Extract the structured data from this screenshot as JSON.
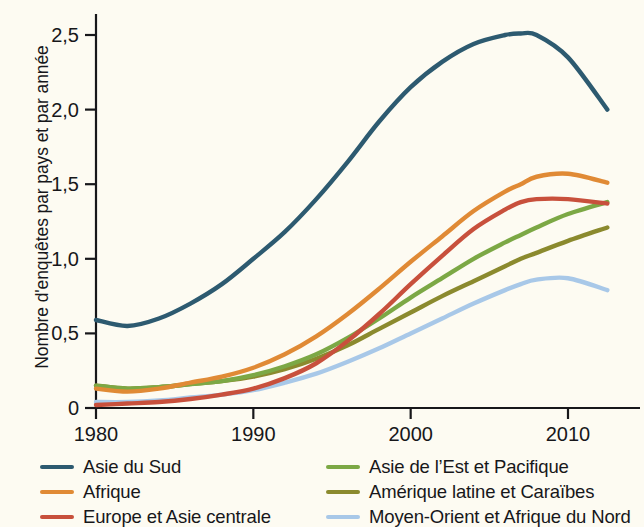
{
  "axes": {
    "y_title": "Nombre d'enquêtes par pays et par année",
    "y_ticks": [
      "2,5",
      "2,0",
      "1,5",
      "1,0",
      "0,5",
      "0"
    ],
    "x_ticks": [
      "1980",
      "1990",
      "2000",
      "2010"
    ]
  },
  "legend": {
    "left": [
      {
        "label": "Asie du Sud",
        "color": "#2d5a70"
      },
      {
        "label": "Afrique",
        "color": "#e08a35"
      },
      {
        "label": "Europe et Asie centrale",
        "color": "#c8503c"
      }
    ],
    "right": [
      {
        "label": "Asie de l’Est et Pacifique",
        "color": "#7ca845"
      },
      {
        "label": "Amérique latine et Caraïbes",
        "color": "#8b8a2e"
      },
      {
        "label": "Moyen-Orient et Afrique du Nord",
        "color": "#a8c8e8"
      }
    ]
  },
  "chart_data": {
    "type": "line",
    "title": "",
    "xlabel": "",
    "ylabel": "Nombre d'enquêtes par pays et par année",
    "xlim": [
      1980,
      2012.5
    ],
    "ylim": [
      0,
      2.65
    ],
    "xticks": [
      1980,
      1990,
      2000,
      2010
    ],
    "yticks": [
      0,
      0.5,
      1.0,
      1.5,
      2.0,
      2.5
    ],
    "ytick_labels": [
      "0",
      "0,5",
      "1,0",
      "1,5",
      "2,0",
      "2,5"
    ],
    "grid": false,
    "legend_position": "below",
    "background": "#fdfbf2",
    "x": [
      1980,
      1982,
      1984,
      1986,
      1988,
      1990,
      1992,
      1994,
      1996,
      1998,
      2000,
      2002,
      2004,
      2006,
      2007,
      2008,
      2010,
      2012.5
    ],
    "series": [
      {
        "name": "Asie du Sud",
        "color": "#2d5a70",
        "values": [
          0.59,
          0.55,
          0.6,
          0.7,
          0.83,
          1.0,
          1.18,
          1.4,
          1.65,
          1.92,
          2.15,
          2.32,
          2.44,
          2.5,
          2.51,
          2.5,
          2.35,
          2.0
        ]
      },
      {
        "name": "Afrique",
        "color": "#e08a35",
        "values": [
          0.13,
          0.11,
          0.13,
          0.17,
          0.21,
          0.27,
          0.36,
          0.48,
          0.63,
          0.8,
          0.98,
          1.15,
          1.32,
          1.45,
          1.5,
          1.55,
          1.57,
          1.51
        ]
      },
      {
        "name": "Europe et Asie centrale",
        "color": "#c8503c",
        "values": [
          0.02,
          0.03,
          0.04,
          0.06,
          0.09,
          0.13,
          0.2,
          0.3,
          0.45,
          0.63,
          0.83,
          1.02,
          1.2,
          1.33,
          1.38,
          1.4,
          1.4,
          1.37
        ]
      },
      {
        "name": "Asie de l’Est et Pacifique",
        "color": "#7ca845",
        "values": [
          0.15,
          0.13,
          0.14,
          0.16,
          0.18,
          0.22,
          0.28,
          0.36,
          0.47,
          0.6,
          0.74,
          0.87,
          1.0,
          1.11,
          1.16,
          1.21,
          1.3,
          1.38
        ]
      },
      {
        "name": "Amérique latine et Caraïbes",
        "color": "#8b8a2e",
        "values": [
          0.15,
          0.13,
          0.14,
          0.16,
          0.18,
          0.21,
          0.26,
          0.33,
          0.42,
          0.53,
          0.64,
          0.75,
          0.85,
          0.95,
          1.0,
          1.04,
          1.12,
          1.21
        ]
      },
      {
        "name": "Moyen-Orient et Afrique du Nord",
        "color": "#a8c8e8",
        "values": [
          0.04,
          0.04,
          0.05,
          0.07,
          0.09,
          0.12,
          0.17,
          0.23,
          0.31,
          0.4,
          0.5,
          0.6,
          0.7,
          0.79,
          0.83,
          0.86,
          0.87,
          0.79
        ]
      }
    ]
  }
}
